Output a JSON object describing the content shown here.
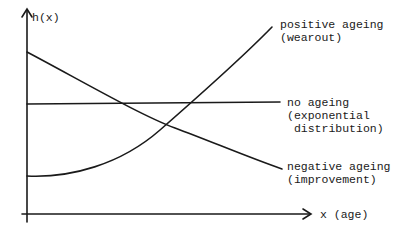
{
  "diagram": {
    "y_axis_label": "h(x)",
    "x_axis_label": "x (age)",
    "curves": [
      {
        "id": "positive",
        "label_line1": "positive ageing",
        "label_line2": "(wearout)",
        "label_line3": "",
        "shape": "increasing convex"
      },
      {
        "id": "none",
        "label_line1": "no ageing",
        "label_line2": "(exponential",
        "label_line3": " distribution)",
        "shape": "constant"
      },
      {
        "id": "negative",
        "label_line1": "negative ageing",
        "label_line2": "(improvement)",
        "label_line3": "",
        "shape": "decreasing"
      }
    ],
    "stroke_color": "#1a1a1a",
    "background": "#ffffff"
  }
}
